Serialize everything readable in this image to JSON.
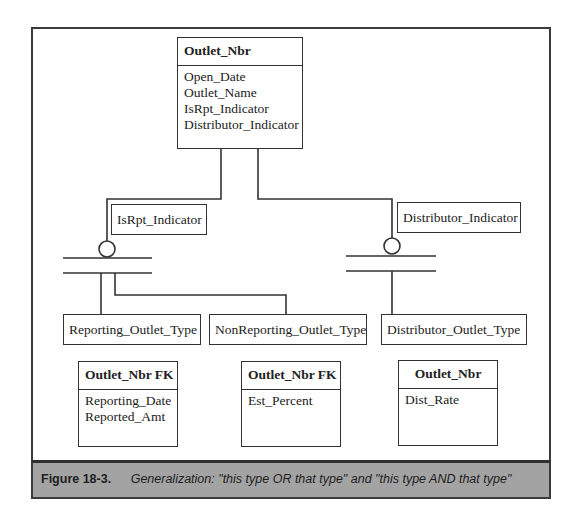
{
  "diagram": {
    "supertype": {
      "key": "Outlet_Nbr",
      "attributes": [
        "Open_Date",
        "Outlet_Name",
        "IsRpt_Indicator",
        "Distributor_Indicator"
      ]
    },
    "discriminators": [
      {
        "label": "IsRpt_Indicator"
      },
      {
        "label": "Distributor_Indicator"
      }
    ],
    "subtype_labels": [
      "Reporting_Outlet_Type",
      "NonReporting_Outlet_Type",
      "Distributor_Outlet_Type"
    ],
    "subtype_entities": [
      {
        "key": "Outlet_Nbr FK",
        "attributes": [
          "Reporting_Date",
          "Reported_Amt"
        ]
      },
      {
        "key": "Outlet_Nbr FK",
        "attributes": [
          "Est_Percent"
        ]
      },
      {
        "key": "Outlet_Nbr",
        "attributes": [
          "Dist_Rate"
        ]
      }
    ]
  },
  "caption": {
    "figure": "Figure  18-3.",
    "text": "Generalization: \"this type OR that type\" and \"this type AND that type\""
  }
}
